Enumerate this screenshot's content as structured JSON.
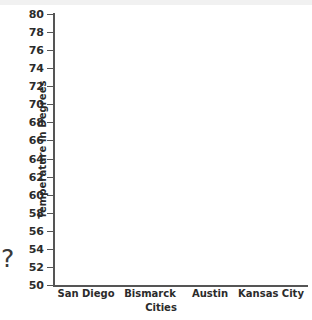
{
  "chart_data": {
    "type": "bar",
    "title": "",
    "subtitle": "",
    "xlabel": "Cities",
    "ylabel": "Temperature in Degrees",
    "categories": [
      "San Diego",
      "Bismarck",
      "Austin",
      "Kansas City"
    ],
    "values": [
      null,
      null,
      null,
      null
    ],
    "series": [
      {
        "name": "Temperature in Degrees",
        "values": [
          null,
          null,
          null,
          null
        ]
      }
    ],
    "ylim": [
      50,
      80
    ],
    "y_ticks": [
      80,
      78,
      76,
      74,
      72,
      70,
      68,
      66,
      64,
      62,
      60,
      58,
      56,
      54,
      52,
      50
    ],
    "y_tick_labels": [
      "80",
      "78",
      "76",
      "74",
      "72",
      "70",
      "68",
      "66",
      "64",
      "62",
      "60",
      "58",
      "56",
      "54",
      "52",
      "50"
    ],
    "y_tick_step": 2,
    "x_ticks": [],
    "grid": false,
    "legend": false,
    "legend_position": "none",
    "plot_empty": true,
    "annotations": [
      "?"
    ],
    "colors": {
      "axis": "#555555",
      "text": "#2b2b2b",
      "background": "#ffffff",
      "top_band": "#f1f1f1",
      "annotation": "#3a3a3a"
    }
  },
  "axes": {
    "y": {
      "title": "Temperature in Degrees",
      "ticks": [
        {
          "label": "80",
          "value": 80
        },
        {
          "label": "78",
          "value": 78
        },
        {
          "label": "76",
          "value": 76
        },
        {
          "label": "74",
          "value": 74
        },
        {
          "label": "72",
          "value": 72
        },
        {
          "label": "70",
          "value": 70
        },
        {
          "label": "68",
          "value": 68
        },
        {
          "label": "66",
          "value": 66
        },
        {
          "label": "64",
          "value": 64
        },
        {
          "label": "62",
          "value": 62
        },
        {
          "label": "60",
          "value": 60
        },
        {
          "label": "58",
          "value": 58
        },
        {
          "label": "56",
          "value": 56
        },
        {
          "label": "54",
          "value": 54
        },
        {
          "label": "52",
          "value": 52
        },
        {
          "label": "50",
          "value": 50
        }
      ]
    },
    "x": {
      "title": "Cities",
      "categories": [
        {
          "label": "San Diego",
          "center": 86
        },
        {
          "label": "Bismarck",
          "center": 150
        },
        {
          "label": "Austin",
          "center": 210
        },
        {
          "label": "Kansas City",
          "center": 271
        }
      ]
    }
  },
  "annotation": {
    "question_mark": "?"
  }
}
